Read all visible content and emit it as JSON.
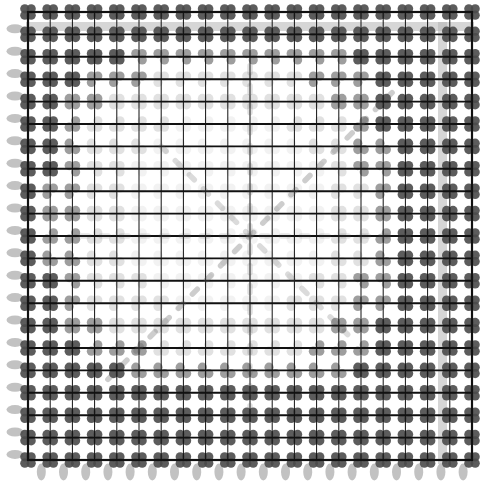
{
  "figure": {
    "title": "",
    "type": "lattice-dot-grid",
    "width": 494,
    "height": 498,
    "background_color": "#ffffff"
  },
  "grid": {
    "columns": 20,
    "rows": 20,
    "x0": 28,
    "y0": 12,
    "x1": 472,
    "y1": 460,
    "cell_width": 22.2,
    "cell_height": 22.4,
    "line_color": "#111111",
    "line_width": 1.9,
    "minor_line_color": "#111111",
    "minor_line_width": 1.0
  },
  "nodes": {
    "shape": "clover-cluster",
    "lobe_count": 4,
    "lobe_radius": 4.6,
    "lobe_offset": 3.2,
    "dark_color": "#4a4a4a",
    "mid_color": "#7d7d7d",
    "light_color": "#c9c9c9",
    "faint_color": "#e2e2e2",
    "center_fade": true,
    "fade_radius_cells": 7.5
  },
  "diagonals": {
    "main_color": "#5a5a5a",
    "dash_pattern": "dash",
    "description": "faint dashed diagonal streaks radiating from grid centre",
    "lines": [
      {
        "x1": 0.18,
        "y1": 0.82,
        "x2": 0.82,
        "y2": 0.18,
        "weight": 0.55
      },
      {
        "x1": 0.3,
        "y1": 0.3,
        "x2": 0.72,
        "y2": 0.72,
        "weight": 0.4
      },
      {
        "x1": 0.5,
        "y1": 0.12,
        "x2": 0.5,
        "y2": 0.88,
        "weight": 0.35
      },
      {
        "x1": 0.12,
        "y1": 0.5,
        "x2": 0.88,
        "y2": 0.5,
        "weight": 0.3
      }
    ]
  },
  "margins": {
    "top_band": {
      "color": "#b4b4b4",
      "opacity": 0.55,
      "y": 22,
      "height": 9,
      "label": "top-gray-band"
    },
    "right_band": {
      "color": "#b4b4b4",
      "opacity": 0.55,
      "x": 438,
      "width": 9,
      "label": "right-gray-band"
    },
    "left_ticks": {
      "color": "#9a9a9a",
      "opacity": 0.6,
      "shape": "horizontal-blob",
      "width": 17,
      "height": 9,
      "count": 20,
      "label": "left-margin-blobs"
    },
    "bottom_ticks": {
      "color": "#9a9a9a",
      "opacity": 0.6,
      "shape": "vertical-blob",
      "width": 9,
      "height": 17,
      "count": 20,
      "label": "bottom-margin-blobs"
    }
  },
  "chart_data": {
    "type": "heatmap",
    "title": "",
    "xlabel": "",
    "ylabel": "",
    "grid": true,
    "legend": "none",
    "xlim": [
      0,
      20
    ],
    "ylim": [
      0,
      20
    ],
    "categories": [
      "c00",
      "c01",
      "c02",
      "c03",
      "c04",
      "c05",
      "c06",
      "c07",
      "c08",
      "c09",
      "c10",
      "c11",
      "c12",
      "c13",
      "c14",
      "c15",
      "c16",
      "c17",
      "c18",
      "c19"
    ],
    "values": [
      [
        3,
        3,
        3,
        3,
        3,
        3,
        3,
        3,
        3,
        3,
        3,
        3,
        3,
        3,
        3,
        3,
        3,
        3,
        3,
        3
      ],
      [
        3,
        3,
        3,
        3,
        3,
        3,
        3,
        3,
        3,
        3,
        3,
        3,
        3,
        3,
        3,
        3,
        3,
        3,
        3,
        3
      ],
      [
        3,
        3,
        3,
        3,
        3,
        2,
        2,
        2,
        2,
        2,
        2,
        2,
        2,
        2,
        2,
        3,
        3,
        3,
        3,
        3
      ],
      [
        3,
        3,
        3,
        2,
        2,
        2,
        1,
        1,
        1,
        1,
        1,
        1,
        1,
        2,
        2,
        2,
        3,
        3,
        3,
        3
      ],
      [
        3,
        3,
        2,
        2,
        1,
        1,
        1,
        1,
        1,
        1,
        1,
        1,
        1,
        1,
        2,
        2,
        3,
        3,
        3,
        3
      ],
      [
        3,
        3,
        2,
        1,
        1,
        1,
        1,
        0,
        0,
        0,
        0,
        0,
        1,
        1,
        1,
        2,
        3,
        3,
        3,
        3
      ],
      [
        3,
        3,
        2,
        1,
        1,
        1,
        0,
        0,
        0,
        0,
        0,
        0,
        0,
        1,
        1,
        2,
        2,
        3,
        3,
        3
      ],
      [
        3,
        3,
        2,
        1,
        1,
        0,
        0,
        0,
        0,
        0,
        0,
        0,
        0,
        0,
        1,
        2,
        2,
        3,
        3,
        3
      ],
      [
        3,
        2,
        2,
        1,
        1,
        0,
        0,
        0,
        0,
        0,
        0,
        0,
        0,
        0,
        1,
        1,
        2,
        3,
        3,
        3
      ],
      [
        3,
        2,
        2,
        1,
        1,
        0,
        0,
        0,
        0,
        0,
        0,
        0,
        0,
        0,
        1,
        1,
        2,
        3,
        3,
        3
      ],
      [
        3,
        2,
        2,
        1,
        1,
        0,
        0,
        0,
        0,
        0,
        0,
        0,
        0,
        0,
        1,
        1,
        2,
        3,
        3,
        3
      ],
      [
        3,
        2,
        2,
        1,
        1,
        0,
        0,
        0,
        0,
        0,
        0,
        0,
        0,
        0,
        1,
        1,
        2,
        3,
        3,
        3
      ],
      [
        3,
        3,
        2,
        1,
        1,
        1,
        0,
        0,
        0,
        0,
        0,
        0,
        0,
        1,
        1,
        2,
        2,
        3,
        3,
        3
      ],
      [
        3,
        3,
        2,
        1,
        1,
        1,
        1,
        0,
        0,
        0,
        0,
        0,
        1,
        1,
        1,
        2,
        2,
        3,
        3,
        3
      ],
      [
        3,
        3,
        2,
        2,
        1,
        1,
        1,
        1,
        1,
        1,
        1,
        1,
        1,
        1,
        2,
        2,
        3,
        3,
        3,
        3
      ],
      [
        3,
        3,
        3,
        2,
        2,
        2,
        1,
        1,
        1,
        1,
        1,
        1,
        1,
        2,
        2,
        2,
        3,
        3,
        3,
        3
      ],
      [
        3,
        3,
        3,
        3,
        3,
        2,
        2,
        2,
        2,
        2,
        2,
        2,
        2,
        2,
        2,
        3,
        3,
        3,
        3,
        3
      ],
      [
        3,
        3,
        3,
        3,
        3,
        3,
        3,
        3,
        3,
        3,
        3,
        3,
        3,
        3,
        3,
        3,
        3,
        3,
        3,
        3
      ],
      [
        3,
        3,
        3,
        3,
        3,
        3,
        3,
        3,
        3,
        3,
        3,
        3,
        3,
        3,
        3,
        3,
        3,
        3,
        3,
        3
      ],
      [
        3,
        3,
        3,
        3,
        3,
        3,
        3,
        3,
        3,
        3,
        3,
        3,
        3,
        3,
        3,
        3,
        3,
        3,
        3,
        3
      ]
    ],
    "value_legend": {
      "0": "faintest node ink",
      "1": "light node ink",
      "2": "medium node ink",
      "3": "darkest node ink"
    }
  }
}
